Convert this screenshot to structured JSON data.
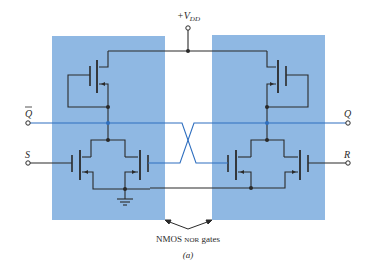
{
  "figure": {
    "caption": "(a)",
    "annotation": "NMOS NOR gates",
    "annotation_main": "NMOS ",
    "annotation_smallcaps": "NOR",
    "annotation_tail": " gates"
  },
  "terminals": {
    "supply": {
      "plus": "+",
      "V": "V",
      "sub": "DD"
    },
    "qbar": "Q",
    "q": "Q",
    "s": "S",
    "r": "R"
  },
  "colors": {
    "gate_box_fill": "#8fb8e3",
    "wire": "#2a2a2a",
    "output_wire": "#2f6fbf",
    "background": "#ffffff"
  },
  "gates": [
    {
      "name": "left-nor-gate",
      "inputs": [
        "S",
        "Q"
      ],
      "output": "Q̄"
    },
    {
      "name": "right-nor-gate",
      "inputs": [
        "Q̄",
        "R"
      ],
      "output": "Q"
    }
  ]
}
